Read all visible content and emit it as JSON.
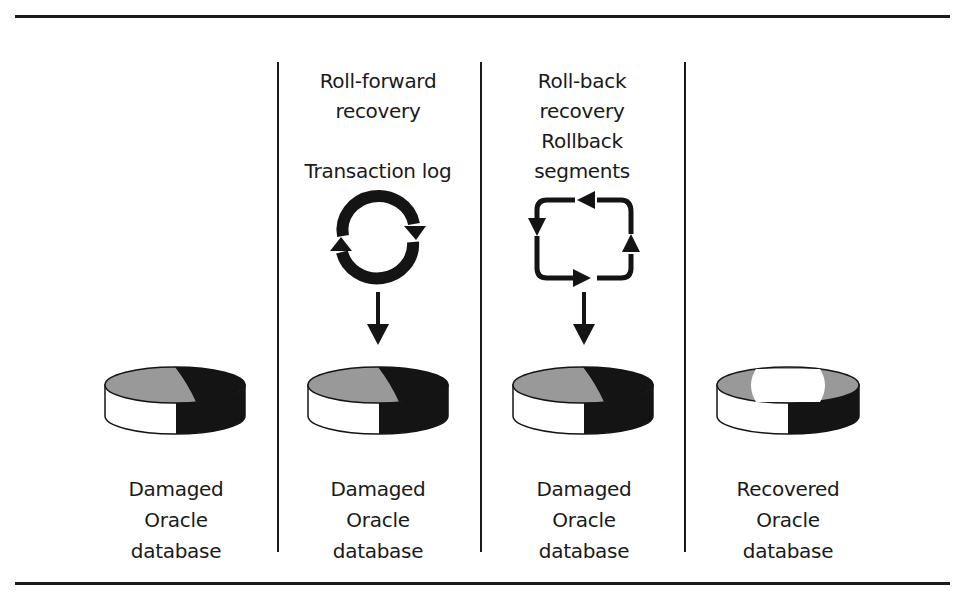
{
  "diagram": {
    "title": "",
    "colors": {
      "ink": "#1a1a1a",
      "gray_fill": "#999999",
      "white_fill": "#ffffff",
      "dark_fill": "#141414"
    },
    "columns": [
      {
        "id": "damaged-1",
        "header": "",
        "sub_header": "",
        "icon": "",
        "caption": "Damaged\nOracle\ndatabase",
        "database_state": "damaged"
      },
      {
        "id": "roll-forward",
        "header": "Roll-forward\nrecovery",
        "sub_header": "Transaction log",
        "icon": "circular-arrows-icon",
        "caption": "Damaged\nOracle\ndatabase",
        "database_state": "damaged"
      },
      {
        "id": "roll-back",
        "header": "Roll-back\nrecovery",
        "sub_header": "Rollback\nsegments",
        "icon": "rectangular-cycle-arrows-icon",
        "caption": "Damaged\nOracle\ndatabase",
        "database_state": "damaged"
      },
      {
        "id": "recovered",
        "header": "",
        "sub_header": "",
        "icon": "",
        "caption": "Recovered\nOracle\ndatabase",
        "database_state": "recovered"
      }
    ]
  }
}
